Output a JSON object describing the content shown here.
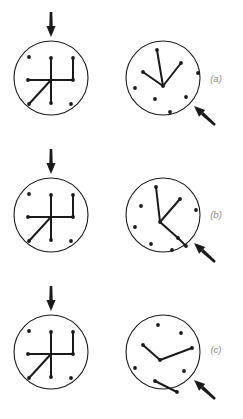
{
  "figure": {
    "type": "diagram",
    "background_color": "#ffffff",
    "stroke_color": "#1a1a1a",
    "dot_color": "#1a1a1a",
    "label_color": "#8a8a8a",
    "circle_stroke_width": 1.1,
    "line_stroke_width": 2.0,
    "dot_radius": 1.9,
    "width": 243,
    "height": 419
  },
  "panels": [
    {
      "id": "panel-a",
      "label": "(a)",
      "label_x": 216,
      "label_y": 79,
      "row_y": 0,
      "stimulus": {
        "name": "stimulus-circle-a",
        "circle": {
          "cx": 51,
          "cy": 78,
          "r": 37
        },
        "arrow": {
          "name": "down-arrow-a",
          "direction": "down",
          "x1": 51,
          "y1": 12,
          "x2": 51,
          "y2": 37
        },
        "lines": [
          {
            "x1": 51,
            "y1": 58,
            "x2": 51,
            "y2": 103
          },
          {
            "x1": 28,
            "y1": 80,
            "x2": 73,
            "y2": 80
          },
          {
            "x1": 73,
            "y1": 80,
            "x2": 73,
            "y2": 58
          },
          {
            "x1": 51,
            "y1": 80,
            "x2": 29,
            "y2": 104
          }
        ],
        "dots": [
          {
            "cx": 51,
            "cy": 58
          },
          {
            "cx": 51,
            "cy": 103
          },
          {
            "cx": 28,
            "cy": 80
          },
          {
            "cx": 73,
            "cy": 80
          },
          {
            "cx": 73,
            "cy": 58
          },
          {
            "cx": 29,
            "cy": 104
          },
          {
            "cx": 29,
            "cy": 57
          },
          {
            "cx": 71,
            "cy": 104
          }
        ]
      },
      "response": {
        "name": "response-circle-a",
        "circle": {
          "cx": 163,
          "cy": 78,
          "r": 37
        },
        "arrow": {
          "name": "diagonal-arrow-a",
          "direction": "up-left",
          "x1": 215,
          "y1": 125,
          "x2": 194,
          "y2": 106
        },
        "lines": [
          {
            "x1": 163,
            "y1": 86,
            "x2": 157,
            "y2": 50
          },
          {
            "x1": 163,
            "y1": 86,
            "x2": 181,
            "y2": 63
          },
          {
            "x1": 163,
            "y1": 86,
            "x2": 143,
            "y2": 72
          }
        ],
        "dots": [
          {
            "cx": 157,
            "cy": 50
          },
          {
            "cx": 181,
            "cy": 63
          },
          {
            "cx": 143,
            "cy": 72
          },
          {
            "cx": 163,
            "cy": 86
          },
          {
            "cx": 198,
            "cy": 73
          },
          {
            "cx": 135,
            "cy": 88
          },
          {
            "cx": 155,
            "cy": 99
          },
          {
            "cx": 186,
            "cy": 97
          },
          {
            "cx": 170,
            "cy": 112
          }
        ]
      }
    },
    {
      "id": "panel-b",
      "label": "(b)",
      "label_x": 216,
      "label_y": 215,
      "row_y": 137,
      "stimulus": {
        "name": "stimulus-circle-b",
        "circle": {
          "cx": 51,
          "cy": 215,
          "r": 37
        },
        "arrow": {
          "name": "down-arrow-b",
          "direction": "down",
          "x1": 51,
          "y1": 149,
          "x2": 51,
          "y2": 174
        },
        "lines": [
          {
            "x1": 51,
            "y1": 195,
            "x2": 51,
            "y2": 240
          },
          {
            "x1": 28,
            "y1": 217,
            "x2": 73,
            "y2": 217
          },
          {
            "x1": 73,
            "y1": 217,
            "x2": 73,
            "y2": 195
          },
          {
            "x1": 51,
            "y1": 217,
            "x2": 29,
            "y2": 241
          }
        ],
        "dots": [
          {
            "cx": 51,
            "cy": 195
          },
          {
            "cx": 51,
            "cy": 240
          },
          {
            "cx": 28,
            "cy": 217
          },
          {
            "cx": 73,
            "cy": 217
          },
          {
            "cx": 73,
            "cy": 195
          },
          {
            "cx": 29,
            "cy": 241
          },
          {
            "cx": 29,
            "cy": 194
          },
          {
            "cx": 71,
            "cy": 241
          }
        ]
      },
      "response": {
        "name": "response-circle-b",
        "circle": {
          "cx": 163,
          "cy": 215,
          "r": 37
        },
        "arrow": {
          "name": "diagonal-arrow-b",
          "direction": "up-left",
          "x1": 215,
          "y1": 262,
          "x2": 194,
          "y2": 243
        },
        "lines": [
          {
            "x1": 160,
            "y1": 222,
            "x2": 156,
            "y2": 187
          },
          {
            "x1": 160,
            "y1": 222,
            "x2": 180,
            "y2": 199
          },
          {
            "x1": 160,
            "y1": 222,
            "x2": 178,
            "y2": 238
          },
          {
            "x1": 178,
            "y1": 238,
            "x2": 186,
            "y2": 246
          }
        ],
        "dots": [
          {
            "cx": 156,
            "cy": 187
          },
          {
            "cx": 180,
            "cy": 199
          },
          {
            "cx": 160,
            "cy": 222
          },
          {
            "cx": 178,
            "cy": 238
          },
          {
            "cx": 186,
            "cy": 246
          },
          {
            "cx": 196,
            "cy": 210
          },
          {
            "cx": 141,
            "cy": 206
          },
          {
            "cx": 135,
            "cy": 227
          },
          {
            "cx": 151,
            "cy": 244
          },
          {
            "cx": 172,
            "cy": 250
          }
        ]
      }
    },
    {
      "id": "panel-c",
      "label": "(c)",
      "label_x": 216,
      "label_y": 350,
      "row_y": 274,
      "stimulus": {
        "name": "stimulus-circle-c",
        "circle": {
          "cx": 51,
          "cy": 352,
          "r": 37
        },
        "arrow": {
          "name": "down-arrow-c",
          "direction": "down",
          "x1": 51,
          "y1": 286,
          "x2": 51,
          "y2": 311
        },
        "lines": [
          {
            "x1": 51,
            "y1": 332,
            "x2": 51,
            "y2": 377
          },
          {
            "x1": 28,
            "y1": 354,
            "x2": 73,
            "y2": 354
          },
          {
            "x1": 73,
            "y1": 354,
            "x2": 73,
            "y2": 332
          },
          {
            "x1": 51,
            "y1": 354,
            "x2": 29,
            "y2": 378
          }
        ],
        "dots": [
          {
            "cx": 51,
            "cy": 332
          },
          {
            "cx": 51,
            "cy": 377
          },
          {
            "cx": 28,
            "cy": 354
          },
          {
            "cx": 73,
            "cy": 354
          },
          {
            "cx": 73,
            "cy": 332
          },
          {
            "cx": 29,
            "cy": 378
          },
          {
            "cx": 29,
            "cy": 331
          },
          {
            "cx": 71,
            "cy": 378
          }
        ]
      },
      "response": {
        "name": "response-circle-c",
        "circle": {
          "cx": 163,
          "cy": 352,
          "r": 37
        },
        "arrow": {
          "name": "diagonal-arrow-c",
          "direction": "up-left",
          "x1": 215,
          "y1": 399,
          "x2": 194,
          "y2": 380
        },
        "lines": [
          {
            "x1": 143,
            "y1": 345,
            "x2": 160,
            "y2": 360
          },
          {
            "x1": 160,
            "y1": 360,
            "x2": 192,
            "y2": 348
          },
          {
            "x1": 155,
            "y1": 381,
            "x2": 177,
            "y2": 392
          }
        ],
        "dots": [
          {
            "cx": 143,
            "cy": 345
          },
          {
            "cx": 160,
            "cy": 360
          },
          {
            "cx": 192,
            "cy": 348
          },
          {
            "cx": 155,
            "cy": 381
          },
          {
            "cx": 177,
            "cy": 392
          },
          {
            "cx": 158,
            "cy": 325
          },
          {
            "cx": 181,
            "cy": 333
          },
          {
            "cx": 135,
            "cy": 368
          },
          {
            "cx": 184,
            "cy": 371
          }
        ]
      }
    }
  ]
}
